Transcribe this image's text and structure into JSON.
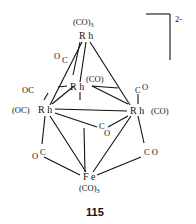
{
  "compound": {
    "number": "115",
    "charge": "2-",
    "atoms": {
      "rh_top": "R h",
      "rh_mid": "R h",
      "rh_left": "R h",
      "rh_right": "R h",
      "fe": "F e"
    },
    "ligands": {
      "top_co3": "(CO)",
      "top_co3_sub": "3",
      "mid_co": "(CO)",
      "left_oc": "(OC)",
      "right_co": "(CO)",
      "fe_co3": "(CO)",
      "fe_co3_sub": "3",
      "bridge_top_left_o": "O",
      "bridge_top_left_c": "C",
      "bridge_left_oc": "OC",
      "bridge_right_c": "C",
      "bridge_right_o": "O",
      "bridge_center_c": "C",
      "bridge_center_o": "O",
      "bridge_lower_left_o": "O",
      "bridge_lower_left_c": "C",
      "bridge_lower_right": "C O"
    }
  }
}
